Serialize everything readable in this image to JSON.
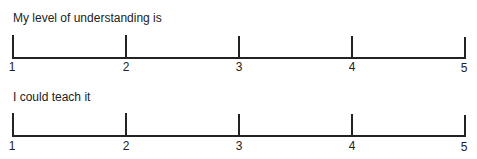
{
  "scales": [
    {
      "prompt": "My level of understanding is",
      "ticks": [
        "1",
        "2",
        "3",
        "4",
        "5"
      ]
    },
    {
      "prompt": "I could teach it",
      "ticks": [
        "1",
        "2",
        "3",
        "4",
        "5"
      ]
    }
  ],
  "colors": {
    "line": "#222222",
    "background": "#ffffff"
  }
}
